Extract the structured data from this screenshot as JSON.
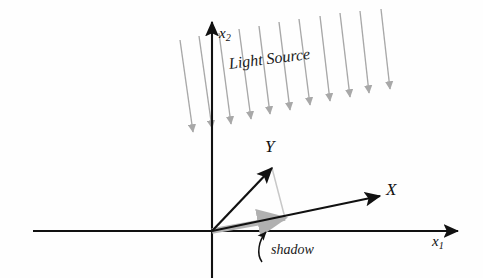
{
  "figure": {
    "type": "diagram",
    "background_color": "#ffffff",
    "axis_color": "#111111",
    "vector_color": "#111111",
    "light_color": "#a8a8a8",
    "shadow_color": "#b4b4b4",
    "projection_color": "#c0c0c0"
  },
  "axes": {
    "horizontal": {
      "label_base": "x",
      "label_sub": "1",
      "label_full": "x1",
      "y": 231,
      "x_start": 33,
      "x_end": 458
    },
    "vertical": {
      "label_base": "x",
      "label_sub": "2",
      "label_full": "x2",
      "x": 212,
      "y_top": 22,
      "y_bottom": 278
    },
    "origin": {
      "x": 212,
      "y": 231
    }
  },
  "vectors": [
    {
      "name": "X",
      "label": "X",
      "from": {
        "x": 212,
        "y": 231
      },
      "to": {
        "x": 380,
        "y": 196
      },
      "color": "#111111"
    },
    {
      "name": "Y",
      "label": "Y",
      "from": {
        "x": 212,
        "y": 231
      },
      "to": {
        "x": 272,
        "y": 168
      },
      "color": "#111111"
    }
  ],
  "shadow": {
    "label": "shadow",
    "from": {
      "x": 212,
      "y": 231
    },
    "to": {
      "x": 285,
      "y": 218
    },
    "color": "#b4b4b4",
    "leader_arrow_tip": {
      "x": 268,
      "y": 228
    }
  },
  "projection_line": {
    "name": "y-to-shadow-projection",
    "from": {
      "x": 272,
      "y": 168
    },
    "to": {
      "x": 285,
      "y": 218
    },
    "color": "#c8c8c8"
  },
  "light_source": {
    "label": "Light Source",
    "ray_count": 11,
    "ray_color": "#a8a8a8",
    "direction_deg": 82,
    "rays": [
      {
        "x1": 180,
        "y1": 40,
        "x2": 193,
        "y2": 132
      },
      {
        "x1": 199,
        "y1": 36,
        "x2": 212,
        "y2": 128
      },
      {
        "x1": 219,
        "y1": 33,
        "x2": 231,
        "y2": 124
      },
      {
        "x1": 239,
        "y1": 29,
        "x2": 251,
        "y2": 119
      },
      {
        "x1": 259,
        "y1": 26,
        "x2": 270,
        "y2": 114
      },
      {
        "x1": 279,
        "y1": 22,
        "x2": 290,
        "y2": 110
      },
      {
        "x1": 299,
        "y1": 19,
        "x2": 310,
        "y2": 105
      },
      {
        "x1": 320,
        "y1": 16,
        "x2": 330,
        "y2": 101
      },
      {
        "x1": 340,
        "y1": 13,
        "x2": 350,
        "y2": 97
      },
      {
        "x1": 360,
        "y1": 11,
        "x2": 369,
        "y2": 93
      },
      {
        "x1": 381,
        "y1": 9,
        "x2": 390,
        "y2": 89
      }
    ]
  }
}
